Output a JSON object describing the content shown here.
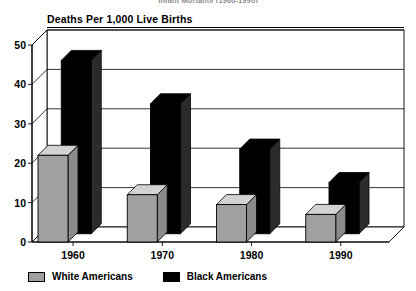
{
  "header": {
    "clipped_title": "Infant Mortality (1960-1990)",
    "subtitle": "Deaths Per 1,000 Live Births"
  },
  "legend": {
    "items": [
      {
        "label": "White Americans",
        "color": "#a0a0a0",
        "name": "white-americans"
      },
      {
        "label": "Black Americans",
        "color": "#000000",
        "name": "black-americans"
      }
    ]
  },
  "axes": {
    "y_ticks": [
      "0",
      "10",
      "20",
      "30",
      "40",
      "50"
    ],
    "x_ticks": [
      "1960",
      "1970",
      "1980",
      "1990"
    ]
  },
  "chart_data": {
    "type": "bar",
    "title": "Infant Mortality (1960-1990)",
    "subtitle": "Deaths Per 1,000 Live Births",
    "xlabel": "",
    "ylabel": "Deaths Per 1,000 Live Births",
    "categories": [
      "1960",
      "1970",
      "1980",
      "1990"
    ],
    "series": [
      {
        "name": "White Americans",
        "color": "#a0a0a0",
        "values": [
          22,
          12,
          9.5,
          7
        ]
      },
      {
        "name": "Black Americans",
        "color": "#000000",
        "values": [
          44,
          33,
          21.5,
          13
        ]
      }
    ],
    "ylim": [
      0,
      50
    ],
    "ytick_interval": 10,
    "grid": true,
    "legend_position": "bottom-left",
    "style": "3d-isometric"
  }
}
